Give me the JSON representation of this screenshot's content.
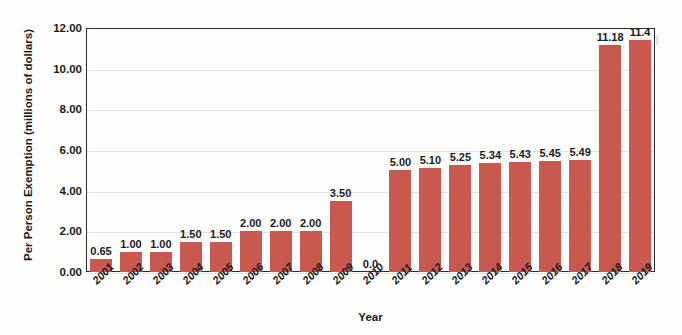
{
  "chart_data": {
    "type": "bar",
    "title": "",
    "xlabel": "Year",
    "ylabel": "Per Person Exemption (millions of dollars)",
    "categories": [
      "2001",
      "2002",
      "2003",
      "2004",
      "2005",
      "2006",
      "2007",
      "2008",
      "2009",
      "2010",
      "2011",
      "2012",
      "2013",
      "2014",
      "2015",
      "2016",
      "2017",
      "2018",
      "2019"
    ],
    "values": [
      0.65,
      1.0,
      1.0,
      1.5,
      1.5,
      2.0,
      2.0,
      2.0,
      3.5,
      0.0,
      5.0,
      5.1,
      5.25,
      5.34,
      5.43,
      5.45,
      5.49,
      11.18,
      11.4
    ],
    "value_labels": [
      "0.65",
      "1.00",
      "1.00",
      "1.50",
      "1.50",
      "2.00",
      "2.00",
      "2.00",
      "3.50",
      "0.0",
      "5.00",
      "5.10",
      "5.25",
      "5.34",
      "5.43",
      "5.45",
      "5.49",
      "11.18",
      "11.4"
    ],
    "ylim": [
      0,
      12
    ],
    "ytick_values": [
      0,
      2,
      4,
      6,
      8,
      10,
      12
    ],
    "ytick_labels": [
      "0.00",
      "2.00",
      "4.00",
      "6.00",
      "8.00",
      "10.00",
      "12.00"
    ],
    "grid": "horizontal",
    "legend": "none",
    "bar_color": "#c9584f",
    "axis_color": "#2b2b2b",
    "gridline_color": "#e2e2e2",
    "text_color": "#1b1b1b"
  },
  "watermark": {
    "text": "noitpmexE"
  }
}
